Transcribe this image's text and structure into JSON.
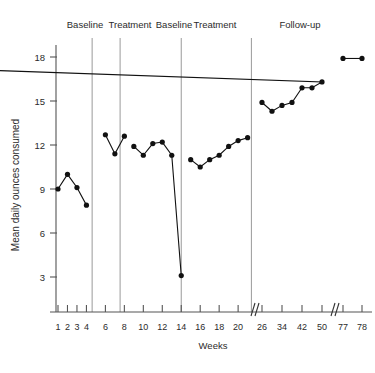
{
  "chart_data": {
    "type": "line",
    "title": "",
    "xlabel": "Weeks",
    "ylabel": "Mean daily ounces consumed",
    "ylim": [
      0,
      19.5
    ],
    "yticks": [
      3,
      6,
      9,
      12,
      15,
      18
    ],
    "ytick_labels": [
      "3",
      "6",
      "9",
      "12",
      "15",
      "18"
    ],
    "xtick_labels": [
      "1",
      "2",
      "3",
      "4",
      "6",
      "8",
      "10",
      "12",
      "14",
      "16",
      "18",
      "20",
      "26",
      "34",
      "42",
      "50",
      "77",
      "78"
    ],
    "xtick_weeks": [
      1,
      2,
      3,
      4,
      6,
      8,
      10,
      12,
      14,
      16,
      18,
      20,
      26,
      34,
      42,
      50,
      77,
      78
    ],
    "grid": false,
    "legend": "none",
    "axis_breaks": [
      21.5,
      52
    ],
    "phases": [
      {
        "name": "Baseline",
        "label": "Baseline",
        "start_week": 1,
        "end_week": 4
      },
      {
        "name": "Treatment",
        "label": "Treatment",
        "start_week": 6,
        "end_week": 8
      },
      {
        "name": "Baseline2",
        "label": "Baseline",
        "start_week": 9,
        "end_week": 14
      },
      {
        "name": "Treatment2",
        "label": "Treatment",
        "start_week": 15,
        "end_week": 21
      },
      {
        "name": "Follow-up",
        "label": "Follow-up",
        "start_week": 24,
        "end_week": 78
      }
    ],
    "phase_dividers_week": [
      4.6,
      7.55,
      14.0,
      21.4
    ],
    "series": [
      {
        "name": "Mean daily ounces consumed",
        "segments": [
          {
            "phase": "Baseline",
            "points": [
              {
                "x": 1,
                "y": 9.0
              },
              {
                "x": 2,
                "y": 10.0
              },
              {
                "x": 3,
                "y": 9.1
              },
              {
                "x": 4,
                "y": 7.9
              }
            ]
          },
          {
            "phase": "Treatment",
            "points": [
              {
                "x": 6,
                "y": 12.7
              },
              {
                "x": 7,
                "y": 11.4
              },
              {
                "x": 8,
                "y": 12.6
              }
            ]
          },
          {
            "phase": "Baseline2",
            "points": [
              {
                "x": 9,
                "y": 11.9
              },
              {
                "x": 10,
                "y": 11.3
              },
              {
                "x": 11,
                "y": 12.1
              },
              {
                "x": 12,
                "y": 12.2
              },
              {
                "x": 13,
                "y": 11.3
              },
              {
                "x": 14,
                "y": 3.1
              }
            ]
          },
          {
            "phase": "Treatment2",
            "points": [
              {
                "x": 15,
                "y": 11.0
              },
              {
                "x": 16,
                "y": 10.5
              },
              {
                "x": 17,
                "y": 11.0
              },
              {
                "x": 18,
                "y": 11.3
              },
              {
                "x": 19,
                "y": 11.9
              },
              {
                "x": 20,
                "y": 12.3
              },
              {
                "x": 21,
                "y": 12.5
              }
            ]
          },
          {
            "phase": "Follow-up",
            "points": [
              {
                "x": 26,
                "y": 14.9
              },
              {
                "x": 30,
                "y": 14.3
              },
              {
                "x": 34,
                "y": 14.7
              },
              {
                "x": 38,
                "y": 14.9
              },
              {
                "x": 42,
                "y": 15.9
              },
              {
                "x": 46,
                "y": 15.9
              },
              {
                "x": 50,
                "y": 16.3
              },
              {
                "x": 54,
                "y": 17.3
              }
            ]
          },
          {
            "phase": "Follow-up-tail",
            "points": [
              {
                "x": 77,
                "y": 17.9
              },
              {
                "x": 78,
                "y": 17.9
              }
            ]
          }
        ]
      }
    ]
  },
  "colors": {
    "line": "#111111",
    "marker": "#111111",
    "axis": "#555555",
    "divider": "#9a9a9a",
    "text": "#2b2b2b",
    "background": "#ffffff"
  }
}
